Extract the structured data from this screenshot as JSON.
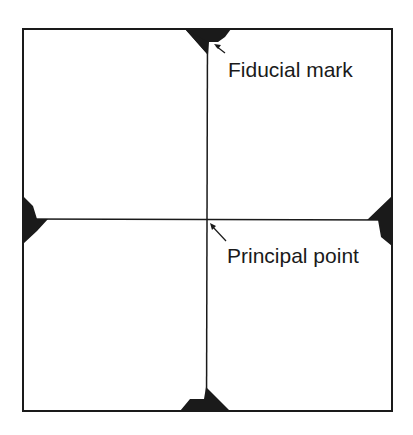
{
  "diagram": {
    "type": "aerial-photograph-frame",
    "labels": {
      "fiducial_mark": "Fiducial mark",
      "principal_point": "Principal point"
    },
    "colors": {
      "background": "#ffffff",
      "ink": "#1a1a1a"
    },
    "elements": {
      "frame": "rectangular photo frame",
      "fiducial_marks": [
        "top",
        "bottom",
        "left",
        "right"
      ],
      "fiducial_lines": [
        "vertical",
        "horizontal"
      ],
      "callouts": [
        "fiducial-mark-arrow",
        "principal-point-arrow"
      ]
    }
  }
}
